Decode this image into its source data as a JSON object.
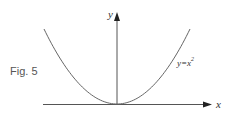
{
  "figure_label": "Fig. 5",
  "chart_data": {
    "type": "line",
    "title": "",
    "xlabel": "x",
    "ylabel": "y",
    "series": [
      {
        "name": "y=x²",
        "function": "y = x^2",
        "x_range": [
          -1,
          1
        ]
      }
    ],
    "curve_label": {
      "base": "y=x",
      "exponent": "2"
    },
    "grid": false,
    "ticks": "none"
  }
}
